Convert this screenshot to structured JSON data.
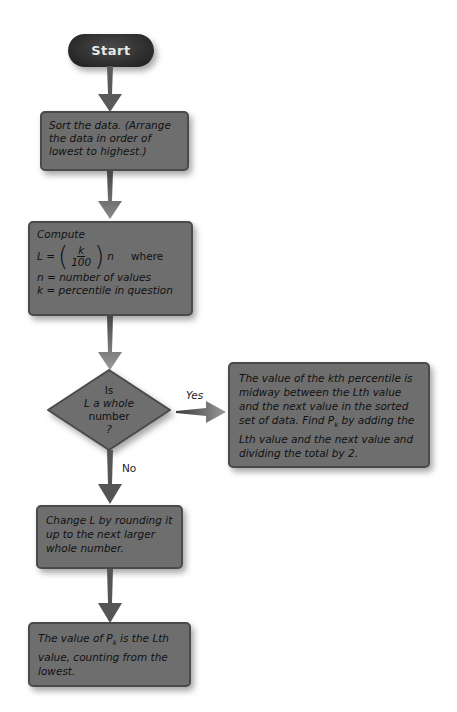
{
  "flowchart": {
    "start": {
      "label": "Start"
    },
    "step_sort": {
      "text": "Sort the data. (Arrange the data in order of lowest to highest.)"
    },
    "step_compute": {
      "title": "Compute",
      "formula_lhs": "L =",
      "formula_num": "k",
      "formula_den": "100",
      "formula_var": "n",
      "formula_where": "where",
      "def_n": "n = number of values",
      "def_k": "k = percentile in question"
    },
    "decision": {
      "line1": "Is",
      "line2": "L a whole",
      "line3": "number",
      "line4": "?"
    },
    "yes_branch": {
      "label": "Yes",
      "text_part1": "The value of the kth percentile is midway between the Lth value and the next value in the sorted set of data. Find P",
      "text_sub": "k",
      "text_part2": " by adding the Lth value and the next value and dividing the total by 2."
    },
    "no_branch": {
      "label": "No",
      "step_round": {
        "text": "Change L by rounding it up to the next larger whole number."
      },
      "step_result": {
        "text_part1": "The value of P",
        "text_sub": "k",
        "text_part2": " is the Lth value, counting from the lowest."
      }
    }
  },
  "colors": {
    "node_fill": "#6e6e6e",
    "node_border": "#4a4a4a",
    "start_fill": "#2a2a2a",
    "arrow": "#5a5a5a"
  }
}
